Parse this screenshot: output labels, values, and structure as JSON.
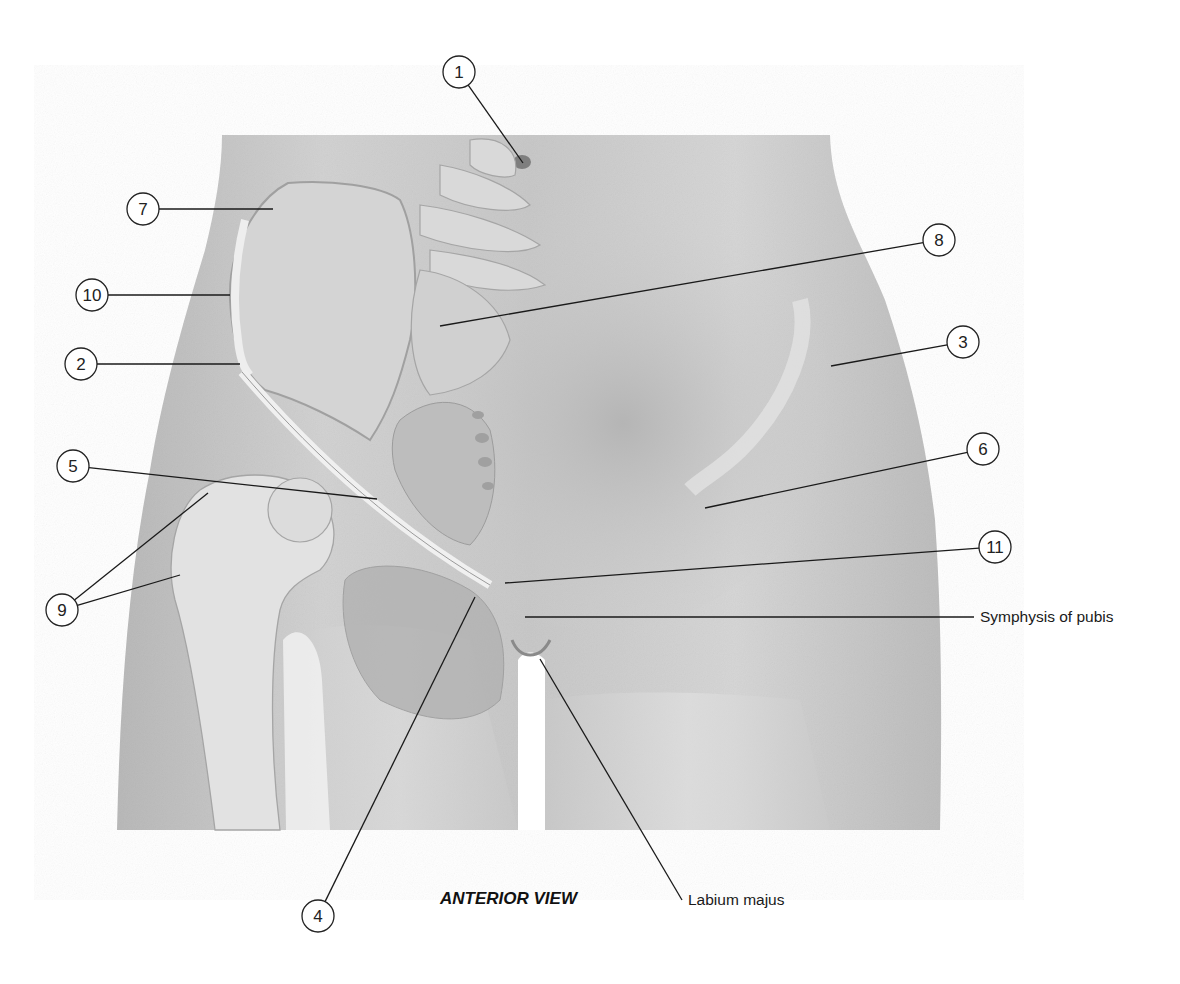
{
  "figure": {
    "caption": "ANTERIOR VIEW",
    "view": "anterior"
  },
  "callouts": [
    {
      "number": "1",
      "cx": 459,
      "cy": 72,
      "target": [
        523,
        163
      ]
    },
    {
      "number": "7",
      "cx": 143,
      "cy": 209,
      "target": [
        273,
        209
      ]
    },
    {
      "number": "8",
      "cx": 939,
      "cy": 240,
      "target": [
        440,
        326
      ]
    },
    {
      "number": "10",
      "cx": 92,
      "cy": 295,
      "target": [
        230,
        295
      ]
    },
    {
      "number": "2",
      "cx": 81,
      "cy": 364,
      "target": [
        240,
        364
      ]
    },
    {
      "number": "3",
      "cx": 963,
      "cy": 342,
      "target": [
        831,
        366
      ]
    },
    {
      "number": "6",
      "cx": 983,
      "cy": 449,
      "target": [
        705,
        508
      ]
    },
    {
      "number": "5",
      "cx": 73,
      "cy": 466,
      "target": [
        377,
        499
      ]
    },
    {
      "number": "11",
      "cx": 995,
      "cy": 547,
      "target": [
        505,
        583
      ]
    },
    {
      "number": "9",
      "cx": 62,
      "cy": 610,
      "targets": [
        [
          208,
          493
        ],
        [
          180,
          575
        ]
      ]
    },
    {
      "number": "4",
      "cx": 318,
      "cy": 916,
      "target": [
        475,
        597
      ]
    }
  ],
  "text_labels": [
    {
      "text": "Symphysis of pubis",
      "x": 980,
      "y": 622,
      "from": [
        525,
        617
      ]
    },
    {
      "text": "Labium majus",
      "x": 688,
      "y": 905,
      "from": [
        540,
        659
      ]
    }
  ],
  "colors": {
    "background": "#ffffff",
    "skin_light": "#dcdcdc",
    "skin_mid": "#c4c4c4",
    "skin_dark": "#a8a8a8",
    "bone": "#e6e6e6",
    "bone_outline": "#9a9a9a",
    "line": "#1a1a1a"
  }
}
